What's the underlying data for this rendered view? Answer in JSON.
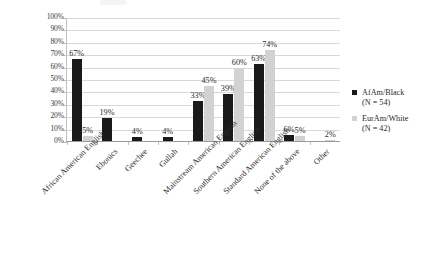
{
  "chart_data": {
    "type": "bar",
    "title": "",
    "xlabel": "",
    "ylabel": "",
    "ylim": [
      0,
      100
    ],
    "ytick_labels": [
      "100%",
      "90%",
      "80%",
      "70%",
      "60%",
      "50%",
      "40%",
      "30%",
      "20%",
      "10%",
      "0%"
    ],
    "ytick_values": [
      100,
      90,
      80,
      70,
      60,
      50,
      40,
      30,
      20,
      10,
      0
    ],
    "grid": true,
    "legend_position": "right",
    "categories": [
      "African American English",
      "Ebonics",
      "Geechee",
      "Gullah",
      "Mainstream American English",
      "Southern American English",
      "Standard American English",
      "None of the above",
      "Other"
    ],
    "series": [
      {
        "name": "AfAm/Black",
        "sublabel": "(N = 54)",
        "color": "#1a1a1a",
        "values": [
          67,
          19,
          4,
          4,
          33,
          39,
          63,
          6,
          0
        ],
        "labels": [
          "67%",
          "19%",
          "4%",
          "4%",
          "33%",
          "39%",
          "63%",
          "6%",
          ""
        ]
      },
      {
        "name": "EurAm/White",
        "sublabel": "(N = 42)",
        "color": "#d2d2d2",
        "values": [
          5,
          0,
          0,
          0,
          45,
          60,
          74,
          5,
          2
        ],
        "labels": [
          "5%",
          "",
          "",
          "",
          "45%",
          "60%",
          "74%",
          "5%",
          "2%"
        ]
      }
    ]
  }
}
